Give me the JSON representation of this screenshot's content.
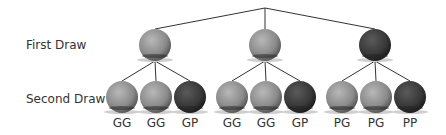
{
  "row_labels": {
    "first": "First Draw",
    "second": "Second Draw"
  },
  "colors": {
    "green": "#8a8a8a",
    "purple": "#3a3a3a",
    "line": "#333333"
  },
  "first_draw": [
    {
      "x": 155,
      "color": "green"
    },
    {
      "x": 265,
      "color": "green"
    },
    {
      "x": 375,
      "color": "purple"
    }
  ],
  "second_draw": [
    {
      "x": 122,
      "color": "green",
      "label": "GG"
    },
    {
      "x": 156,
      "color": "green",
      "label": "GG"
    },
    {
      "x": 190,
      "color": "purple",
      "label": "GP"
    },
    {
      "x": 232,
      "color": "green",
      "label": "GG"
    },
    {
      "x": 266,
      "color": "green",
      "label": "GG"
    },
    {
      "x": 300,
      "color": "purple",
      "label": "GP"
    },
    {
      "x": 342,
      "color": "green",
      "label": "PG"
    },
    {
      "x": 376,
      "color": "green",
      "label": "PG"
    },
    {
      "x": 410,
      "color": "purple",
      "label": "PP"
    }
  ]
}
